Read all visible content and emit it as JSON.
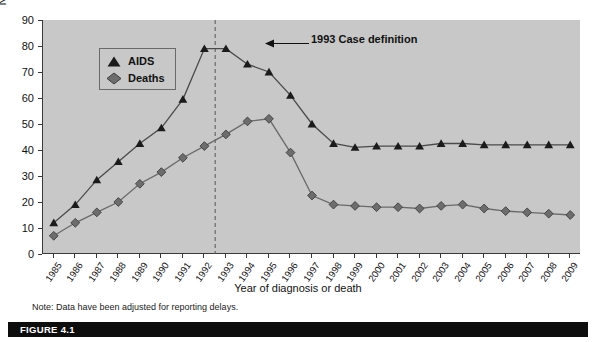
{
  "figure": {
    "caption": "FIGURE 4.1",
    "note": "Note: Data have been adjusted for reporting delays.",
    "annotation": "1993 Case definition"
  },
  "chart_data": {
    "type": "line",
    "title": "",
    "xlabel": "Year of diagnosis or death",
    "ylabel": "No. of cases and deaths (in thousands)",
    "categories": [
      "1985",
      "1986",
      "1987",
      "1988",
      "1989",
      "1990",
      "1991",
      "1992",
      "1993",
      "1994",
      "1995",
      "1996",
      "1997",
      "1998",
      "1999",
      "2000",
      "2001",
      "2002",
      "2003",
      "2004",
      "2005",
      "2006",
      "2007",
      "2008",
      "2009"
    ],
    "ylim": [
      0,
      90
    ],
    "yticks": [
      0,
      10,
      20,
      30,
      40,
      50,
      60,
      70,
      80,
      90
    ],
    "grid": false,
    "legend_position": "top-left",
    "annotations": [
      {
        "label": "1993 Case definition",
        "x": "1993",
        "type": "vline-dashed-with-arrow"
      }
    ],
    "series": [
      {
        "name": "AIDS",
        "marker": "triangle",
        "color": "#1b1b1b",
        "values": [
          12,
          19,
          28.5,
          35.5,
          42.5,
          48.5,
          59.5,
          79,
          79,
          73,
          70,
          61,
          50,
          42.5,
          41,
          41.5,
          41.5,
          41.5,
          42.5,
          42.5,
          42,
          42,
          42,
          42,
          42
        ]
      },
      {
        "name": "Deaths",
        "marker": "diamond",
        "color": "#6d6d6d",
        "values": [
          7,
          12,
          16,
          20,
          27,
          31.5,
          37,
          41.5,
          46,
          51,
          52,
          39,
          22.5,
          19,
          18.5,
          18,
          18,
          17.5,
          18.5,
          19,
          17.5,
          16.5,
          16,
          15.5,
          15
        ]
      }
    ]
  }
}
